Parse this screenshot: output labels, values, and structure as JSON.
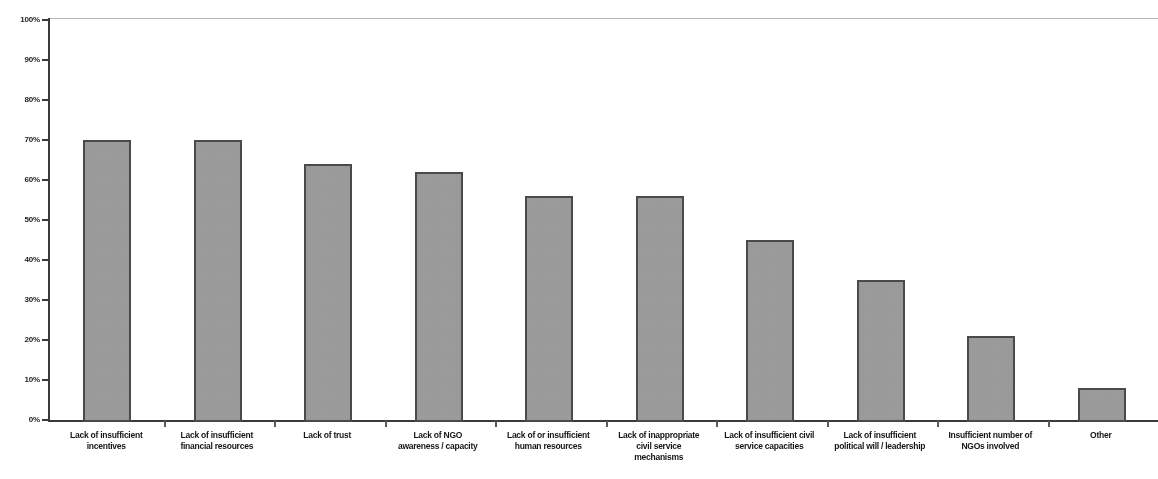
{
  "chart_data": {
    "type": "bar",
    "title": "",
    "subtitle": "",
    "xlabel": "",
    "ylabel": "",
    "ylim": [
      0,
      100
    ],
    "grid": false,
    "legend": false,
    "y_tick_labels": [
      "100%",
      "90%",
      "80%",
      "70%",
      "60%",
      "50%",
      "40%",
      "30%",
      "20%",
      "10%",
      "0%"
    ],
    "y_tick_values": [
      100,
      90,
      80,
      70,
      60,
      50,
      40,
      30,
      20,
      10,
      0
    ],
    "categories": [
      "Lack of insufficient incentives",
      "Lack of insufficient financial resources",
      "Lack of trust",
      "Lack of NGO awareness / capacity",
      "Lack of or insufficient human resources",
      "Lack of inappropriate civil service mechanisms",
      "Lack of insufficient civil service capacities",
      "Lack of insufficient political will / leadership",
      "Insufficient number of NGOs involved",
      "Other"
    ],
    "category_lines": [
      [
        "Lack of insufficient",
        "incentives"
      ],
      [
        "Lack of insufficient",
        "financial resources"
      ],
      [
        "Lack of trust"
      ],
      [
        "Lack of NGO",
        "awareness / capacity"
      ],
      [
        "Lack of or insufficient",
        "human resources"
      ],
      [
        "Lack of inappropriate",
        "civil service",
        "mechanisms"
      ],
      [
        "Lack of insufficient civil",
        "service capacities"
      ],
      [
        "Lack of insufficient",
        "political will / leadership"
      ],
      [
        "Insufficient number of",
        "NGOs involved"
      ],
      [
        "Other"
      ]
    ],
    "values": [
      70,
      70,
      64,
      62,
      56,
      56,
      45,
      35,
      21,
      8
    ],
    "bar_color": "#9e9e9e",
    "bar_edge_color": "#4a4a4a",
    "axis_color": "#3a3a3a"
  }
}
